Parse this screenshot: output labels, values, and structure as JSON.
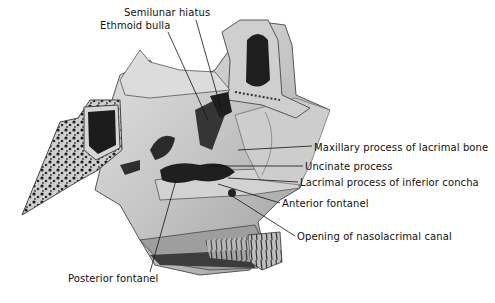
{
  "figure": {
    "colors": {
      "background": "#ffffff",
      "bone_light": "#d9d9d9",
      "bone_mid": "#a8a8a8",
      "bone_dark": "#3a3a3a",
      "cavity": "#1e1e1e",
      "ink": "#111111"
    }
  },
  "labels": [
    {
      "id": "semilunar-hiatus",
      "text": "Semilunar hiatus",
      "x": 124,
      "y": 13
    },
    {
      "id": "ethmoid-bulla",
      "text": "Ethmoid bulla",
      "x": 100,
      "y": 26
    },
    {
      "id": "maxillary-process-lacrimal",
      "text": "Maxillary process of lacrimal bone",
      "x": 314,
      "y": 143
    },
    {
      "id": "uncinate-process",
      "text": "Uncinate process",
      "x": 305,
      "y": 163
    },
    {
      "id": "lacrimal-process-inferior-concha",
      "text": "Lacrimal process of inferior concha",
      "x": 300,
      "y": 179
    },
    {
      "id": "anterior-fontanel",
      "text": "Anterior fontanel",
      "x": 282,
      "y": 200
    },
    {
      "id": "opening-nasolacrimal-canal",
      "text": "Opening of nasolacrimal canal",
      "x": 297,
      "y": 233
    },
    {
      "id": "posterior-fontanel",
      "text": "Posterior fontanel",
      "x": 68,
      "y": 274
    }
  ]
}
